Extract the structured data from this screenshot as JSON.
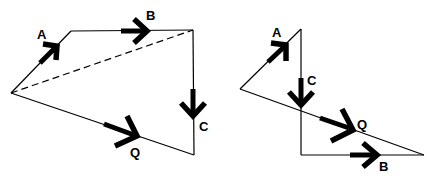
{
  "figure": {
    "left_diagram": {
      "name": "head-to-tail A, B, C",
      "vectors": [
        {
          "id": "A",
          "label": "A"
        },
        {
          "id": "B",
          "label": "B"
        },
        {
          "id": "C",
          "label": "C"
        },
        {
          "id": "Q",
          "label": "Q",
          "role": "resultant"
        }
      ],
      "dashed_line": "intermediate resultant A+B"
    },
    "right_diagram": {
      "name": "head-to-tail A, C, B",
      "vectors": [
        {
          "id": "A",
          "label": "A"
        },
        {
          "id": "C",
          "label": "C"
        },
        {
          "id": "B",
          "label": "B"
        },
        {
          "id": "Q",
          "label": "Q",
          "role": "resultant"
        }
      ]
    }
  },
  "colors": {
    "stroke": "#000000",
    "background": "#ffffff"
  }
}
